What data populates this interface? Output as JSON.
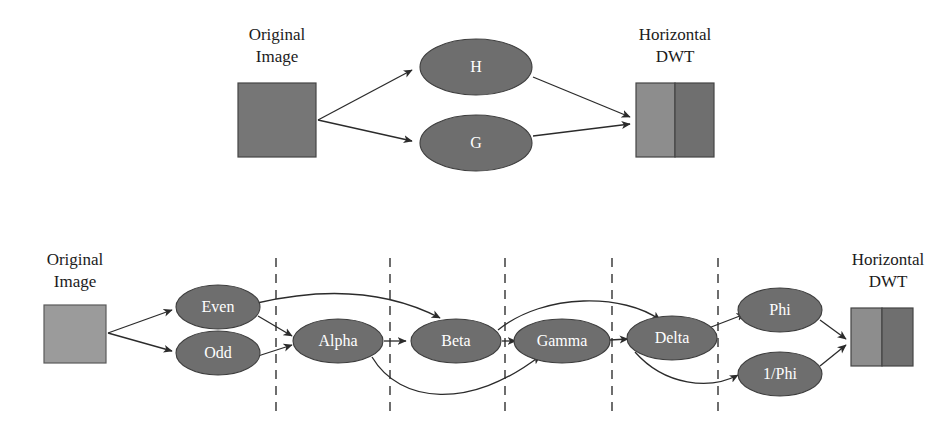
{
  "figure": {
    "title_top": "",
    "background_color": "#ffffff",
    "colors": {
      "ellipse_fill": "#6e6e6e",
      "ellipse_stroke": "#3d3d3d",
      "ellipse_text": "#ffffff",
      "caption_text": "#1b1b1b",
      "edge_stroke": "#2b2b2b",
      "divider_stroke": "#4a4a4a",
      "image_box_top": "#767676",
      "image_box_bottom": "#9b9b9b",
      "dwt_left_half": "#8d8d8d",
      "dwt_right_half": "#6f6f6f"
    }
  },
  "top_diagram": {
    "name": "classic-filter-bank",
    "input_label_line1": "Original",
    "input_label_line2": "Image",
    "output_label_line1": "Horizontal",
    "output_label_line2": "DWT",
    "nodes": [
      {
        "id": "H",
        "label": "H",
        "cx": 476,
        "cy": 67,
        "rx": 56,
        "ry": 28
      },
      {
        "id": "G",
        "label": "G",
        "cx": 476,
        "cy": 143,
        "rx": 56,
        "ry": 28
      }
    ],
    "input_box": {
      "x": 238,
      "y": 83,
      "w": 78,
      "h": 74
    },
    "output_box": {
      "x": 636,
      "y": 83,
      "w": 78,
      "h": 74,
      "split_at": 0.5
    }
  },
  "bottom_diagram": {
    "name": "lifting-scheme-pipeline",
    "input_label_line1": "Original",
    "input_label_line2": "Image",
    "output_label_line1": "Horizontal",
    "output_label_line2": "DWT",
    "nodes": [
      {
        "id": "even",
        "label": "Even",
        "cx": 218,
        "cy": 307,
        "rx": 42,
        "ry": 22
      },
      {
        "id": "odd",
        "label": "Odd",
        "cx": 218,
        "cy": 353,
        "rx": 42,
        "ry": 22
      },
      {
        "id": "alpha",
        "label": "Alpha",
        "cx": 338,
        "cy": 341,
        "rx": 45,
        "ry": 22
      },
      {
        "id": "beta",
        "label": "Beta",
        "cx": 456,
        "cy": 341,
        "rx": 45,
        "ry": 22
      },
      {
        "id": "gamma",
        "label": "Gamma",
        "cx": 562,
        "cy": 341,
        "rx": 48,
        "ry": 22
      },
      {
        "id": "delta",
        "label": "Delta",
        "cx": 672,
        "cy": 338,
        "rx": 45,
        "ry": 22
      },
      {
        "id": "phi",
        "label": "Phi",
        "cx": 780,
        "cy": 310,
        "rx": 42,
        "ry": 22
      },
      {
        "id": "inv_phi",
        "label": "1/Phi",
        "cx": 780,
        "cy": 374,
        "rx": 42,
        "ry": 22
      }
    ],
    "input_box": {
      "x": 44,
      "y": 305,
      "w": 62,
      "h": 58
    },
    "output_box": {
      "x": 851,
      "y": 308,
      "w": 62,
      "h": 58,
      "split_at": 0.5
    },
    "dividers": [
      {
        "id": "divider-1",
        "x": 276
      },
      {
        "id": "divider-2",
        "x": 390
      },
      {
        "id": "divider-3",
        "x": 505
      },
      {
        "id": "divider-4",
        "x": 612
      },
      {
        "id": "divider-5",
        "x": 718
      }
    ],
    "divider_y_top": 258,
    "divider_y_bottom": 412
  }
}
